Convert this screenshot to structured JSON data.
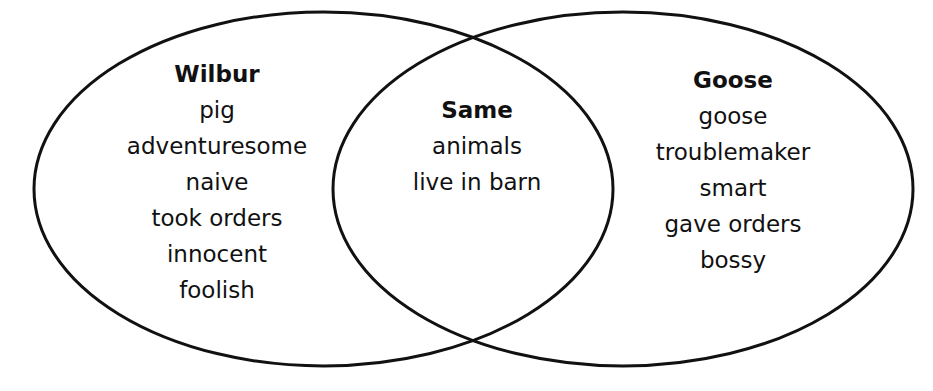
{
  "diagram": {
    "type": "venn",
    "stroke_color": "#111111",
    "background_color": "#ffffff",
    "sets": [
      {
        "title": "Wilbur",
        "items": [
          "pig",
          "adventuresome",
          "naive",
          "took orders",
          "innocent",
          "foolish"
        ]
      },
      {
        "title": "Same",
        "items": [
          "animals",
          "live in barn"
        ]
      },
      {
        "title": "Goose",
        "items": [
          "goose",
          "troublemaker",
          "smart",
          "gave orders",
          "bossy"
        ]
      }
    ]
  }
}
